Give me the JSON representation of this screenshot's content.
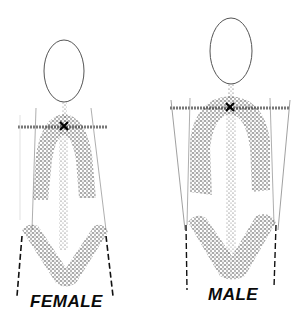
{
  "diagram": {
    "ink_color": "#1a1a1a",
    "stipple_color": "#3a3a3a",
    "figures": [
      {
        "id": "female",
        "label": "FEMALE",
        "head": {
          "cx": 64,
          "cy": 71,
          "rx": 20,
          "ry": 31
        },
        "shoulder_line": {
          "x1": 18,
          "x2": 107,
          "y": 127
        },
        "center_mark": {
          "x": 64,
          "y": 126,
          "symbol": "x-mark"
        },
        "torso_arch": "narrow",
        "hips": "wide",
        "guide_lines": "taper-outward-toward-hips"
      },
      {
        "id": "male",
        "label": "MALE",
        "head": {
          "cx": 231,
          "cy": 51,
          "rx": 21,
          "ry": 33
        },
        "shoulder_line": {
          "x1": 170,
          "x2": 290,
          "y": 108
        },
        "center_mark": {
          "x": 230,
          "y": 107,
          "symbol": "x-mark"
        },
        "torso_arch": "wide",
        "hips": "narrow",
        "guide_lines": "taper-inward-toward-hips"
      }
    ]
  }
}
